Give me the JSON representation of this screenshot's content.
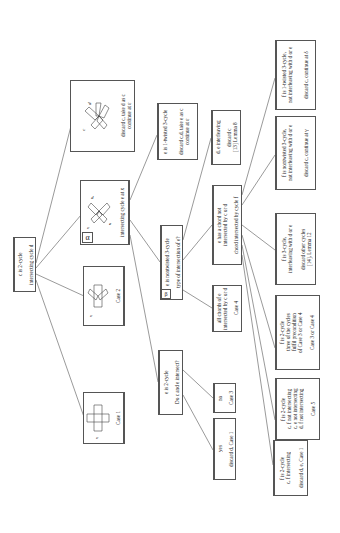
{
  "root": {
    "line1": "c is 2-cycle",
    "line2": "intersecting cycle d"
  },
  "case1_box": {
    "label": "Case 1",
    "fig_label": "c"
  },
  "case2_box": {
    "label": "Case 2",
    "fig_label": "c"
  },
  "alpha_box": {
    "marker": "α",
    "label": "intersecting cycle e at x",
    "fig_labels": [
      "d",
      "c",
      "e"
    ]
  },
  "top_box": {
    "label": "discard c, take d as c\ncontinue at ε",
    "fig_labels": [
      "d",
      "c"
    ]
  },
  "e_1twisted": {
    "line1": "e is 1-twisted 3-cycle",
    "line2": "discard c,d, take e as c\ncontinue at ε"
  },
  "beta_box": {
    "marker": "β",
    "line1": "e is nontwisted 3-cycle",
    "line2": "type of intersection of e?"
  },
  "e_2cycle": {
    "line1": "e is 2-cycle",
    "line2": "Do c and e intersect?"
  },
  "yes_box": {
    "line1": "yes",
    "line2": "discard d, Case 1"
  },
  "no_box": {
    "line1": "no",
    "line2": "Case 3"
  },
  "all_chords": {
    "line1": "all chords of e\nintersected by c or d",
    "line2": "Case 4"
  },
  "has_chord": {
    "line1": "e has a chord not\nintersected by c or d",
    "line2": "chord intersected by cycle f"
  },
  "de_interleaving": {
    "line1": "d, e interleaving",
    "line2": "discard c\n[13] Lemma 8"
  },
  "f_1twisted": {
    "line1": "f is 1-twisted 3-cycle,\nnot interleaving with d or e",
    "line2": "discard c, continue at δ"
  },
  "f_nontwisted": {
    "line1": "f is nontwisted 3-cycle,\nnot interleaving with d or e",
    "line2": "discard c, continue at γ"
  },
  "f_3cycle_inter": {
    "line1": "f is 3-cycle,\ninterleaving with d or e",
    "line2": "discard other cycles\n[14], Lemma 12"
  },
  "f_2cycle_three": {
    "line1": "f is 2-cycle\nthree of the cycles\nfulfil precondition\nof Case 3 or Case 4",
    "line2": "Case 3 or Case 4"
  },
  "f_2cycle_not": {
    "line1": "f is 2-cycle\nc, f not intersecting\nc, e not intersecting\nd, f not intersecting",
    "line2": "Case 5"
  },
  "f_2cycle_inter": {
    "line1": "f is 2-cycle\nc, f intersecting",
    "line2": "discard d, e, Case 1"
  }
}
